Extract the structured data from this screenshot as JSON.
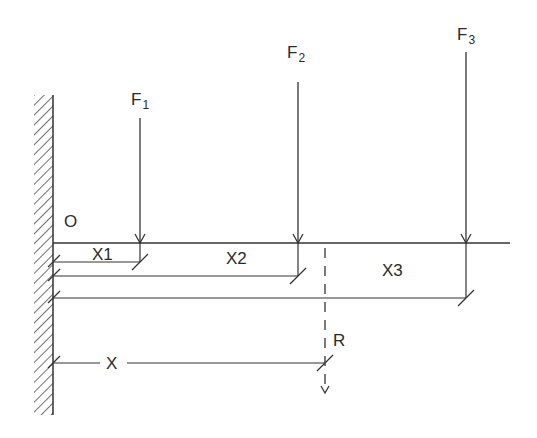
{
  "diagram": {
    "type": "cantilever beam force diagram",
    "origin_label": "O",
    "forces": [
      {
        "name": "F",
        "sub": "1",
        "x_label": "X1"
      },
      {
        "name": "F",
        "sub": "2",
        "x_label": "X2"
      },
      {
        "name": "F",
        "sub": "3",
        "x_label": "X3"
      }
    ],
    "resultant": {
      "label": "R",
      "x_label": "X"
    },
    "line_color": "#333333"
  }
}
